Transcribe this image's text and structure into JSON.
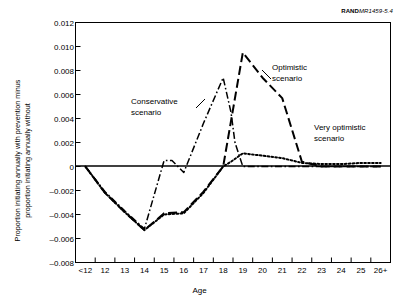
{
  "figure": {
    "source_label_bold": "RAND",
    "source_label_italic": "MR1459-5.4"
  },
  "chart_data": {
    "type": "line",
    "title": "",
    "xlabel": "Age",
    "ylabel": "Proportion initiating annually with prevention minus\nproportion initiating annually without",
    "categories": [
      "<12",
      "12",
      "13",
      "14",
      "15",
      "16",
      "17",
      "18",
      "19",
      "20",
      "21",
      "22",
      "23",
      "24",
      "25",
      "26+"
    ],
    "ylim": [
      -0.008,
      0.012
    ],
    "ytick_values": [
      0.012,
      0.01,
      0.008,
      0.006,
      0.004,
      0.002,
      0,
      -0.002,
      -0.004,
      -0.006,
      -0.008
    ],
    "ytick_labels": [
      "0.012",
      "0.010",
      "0.008",
      "0.006",
      "0.004",
      "0.002",
      "0",
      "–0.002",
      "–0.004",
      "–0.006",
      "–0.008"
    ],
    "grid": false,
    "legend_position": "inline-annotations",
    "zero_line": true,
    "series": [
      {
        "name": "Conservative scenario",
        "linestyle": "dashdot",
        "color": "#000000",
        "annotation": "Conservative\nscenario",
        "x": [
          "<12",
          "12",
          "13",
          "14",
          "15",
          "15.4",
          "16",
          "17",
          "18",
          "18.4",
          "18.6",
          "19",
          "20",
          "21",
          "22",
          "23",
          "24",
          "25",
          "26+"
        ],
        "values": [
          0,
          -0.0021,
          -0.0037,
          -0.0052,
          0.0005,
          0.0005,
          -0.0005,
          0.0036,
          0.0074,
          0.0045,
          0.002,
          0.0,
          0.0,
          0.0,
          0.0,
          0.0,
          0.0,
          0.0,
          0.0
        ]
      },
      {
        "name": "Optimistic scenario",
        "linestyle": "longdash",
        "color": "#000000",
        "annotation": "Optimistic\nscenario",
        "x": [
          "<12",
          "12",
          "13",
          "14",
          "15",
          "16",
          "17",
          "18",
          "19",
          "20",
          "21",
          "22",
          "23",
          "24",
          "25",
          "26+"
        ],
        "values": [
          0,
          -0.0022,
          -0.0038,
          -0.0053,
          -0.0039,
          -0.0038,
          -0.0021,
          0.0,
          0.0095,
          0.0074,
          0.0057,
          0.0004,
          0.0,
          0.0,
          0.0,
          0.0
        ]
      },
      {
        "name": "Very optimistic scenario",
        "linestyle": "dotted",
        "color": "#000000",
        "annotation": "Very optimistic\nscenario",
        "x": [
          "<12",
          "12",
          "13",
          "14",
          "15",
          "16",
          "17",
          "18",
          "18.4",
          "19",
          "20",
          "21",
          "22",
          "23",
          "24",
          "25",
          "26+"
        ],
        "values": [
          0,
          -0.0022,
          -0.0038,
          -0.0053,
          -0.004,
          -0.0039,
          -0.0022,
          0.0,
          0.0004,
          0.0011,
          0.0009,
          0.0007,
          0.0003,
          0.0002,
          0.0002,
          0.0003,
          0.0003
        ]
      }
    ]
  }
}
